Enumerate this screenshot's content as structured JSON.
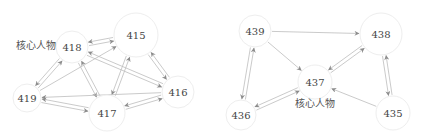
{
  "graphs": [
    {
      "name": "left-network",
      "core_label": "核心人物",
      "core_label_pos": [
        36,
        45
      ],
      "nodes": [
        {
          "id": "415",
          "label": "415",
          "x": 136,
          "y": 35,
          "r": 22
        },
        {
          "id": "416",
          "label": "416",
          "x": 178,
          "y": 92,
          "r": 16
        },
        {
          "id": "417",
          "label": "417",
          "x": 107,
          "y": 113,
          "r": 18
        },
        {
          "id": "418",
          "label": "418",
          "x": 72,
          "y": 47,
          "r": 16
        },
        {
          "id": "419",
          "label": "419",
          "x": 27,
          "y": 98,
          "r": 14
        }
      ],
      "edges": [
        {
          "from": "418",
          "to": "415",
          "bidirectional": true
        },
        {
          "from": "419",
          "to": "415",
          "bidirectional": false
        },
        {
          "from": "418",
          "to": "419",
          "bidirectional": true
        },
        {
          "from": "418",
          "to": "417",
          "bidirectional": true
        },
        {
          "from": "418",
          "to": "416",
          "bidirectional": true
        },
        {
          "from": "415",
          "to": "417",
          "bidirectional": true
        },
        {
          "from": "415",
          "to": "416",
          "bidirectional": true
        },
        {
          "from": "419",
          "to": "417",
          "bidirectional": true
        },
        {
          "from": "416",
          "to": "419",
          "bidirectional": false
        },
        {
          "from": "417",
          "to": "416",
          "bidirectional": true
        }
      ]
    },
    {
      "name": "right-network",
      "core_label": "核心人物",
      "core_label_pos": [
        315,
        103
      ],
      "nodes": [
        {
          "id": "435",
          "label": "435",
          "x": 393,
          "y": 113,
          "r": 17
        },
        {
          "id": "436",
          "label": "436",
          "x": 241,
          "y": 115,
          "r": 15
        },
        {
          "id": "437",
          "label": "437",
          "x": 315,
          "y": 82,
          "r": 17
        },
        {
          "id": "438",
          "label": "438",
          "x": 381,
          "y": 34,
          "r": 21
        },
        {
          "id": "439",
          "label": "439",
          "x": 255,
          "y": 31,
          "r": 16
        }
      ],
      "edges": [
        {
          "from": "439",
          "to": "438",
          "bidirectional": false
        },
        {
          "from": "439",
          "to": "437",
          "bidirectional": false
        },
        {
          "from": "439",
          "to": "436",
          "bidirectional": true
        },
        {
          "from": "438",
          "to": "437",
          "bidirectional": true
        },
        {
          "from": "438",
          "to": "435",
          "bidirectional": true
        },
        {
          "from": "437",
          "to": "436",
          "bidirectional": true
        },
        {
          "from": "435",
          "to": "437",
          "bidirectional": false
        }
      ]
    }
  ],
  "colors": {
    "edge": "#bdbdbd",
    "arrow": "#8c8c8c",
    "node_stroke": "#eeeeee",
    "node_fill": "#ffffff",
    "text": "#444444"
  }
}
